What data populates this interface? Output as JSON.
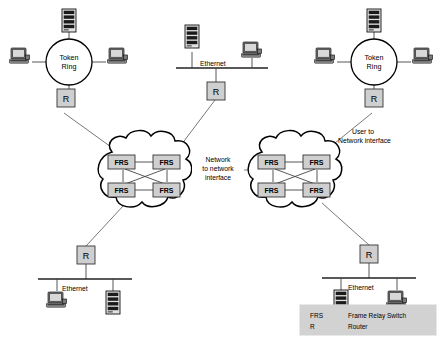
{
  "diagram": {
    "background_color": "#ffffff",
    "line_color": "#555555",
    "node_fill": "#cfcfcf",
    "legend_fill": "#d2d2d2"
  },
  "labels": {
    "token_ring_left_line1": "Token",
    "token_ring_left_line2": "Ring",
    "token_ring_right_line1": "Token",
    "token_ring_right_line2": "Ring",
    "router": "R",
    "frs": "FRS",
    "ethernet_top": "Ethernet",
    "ethernet_bottom_left": "Ethernet",
    "ethernet_bottom_right": "Ethernet"
  },
  "annotations": [
    {
      "name": "network-to-network-interface",
      "line1": "Network",
      "line2": "to network",
      "line3": "interface"
    },
    {
      "name": "user-to-network-interface",
      "line1": "User to",
      "line2": "Network interface"
    }
  ],
  "legend": {
    "rows": [
      {
        "abbr": "FRS",
        "meaning": "Frame Relay Switch"
      },
      {
        "abbr": "R",
        "meaning": "Router"
      }
    ]
  },
  "lans": [
    {
      "name": "token-ring-left",
      "type": "token-ring",
      "hosts": [
        "server",
        "workstation",
        "workstation"
      ],
      "router": "R"
    },
    {
      "name": "ethernet-top",
      "type": "ethernet",
      "label": "Ethernet",
      "hosts": [
        "server",
        "workstation"
      ],
      "router": "R"
    },
    {
      "name": "token-ring-right",
      "type": "token-ring",
      "hosts": [
        "server",
        "workstation",
        "workstation"
      ],
      "router": "R"
    },
    {
      "name": "ethernet-bottom-left",
      "type": "ethernet",
      "label": "Ethernet",
      "hosts": [
        "workstation",
        "server"
      ],
      "router": "R"
    },
    {
      "name": "ethernet-bottom-right",
      "type": "ethernet",
      "label": "Ethernet",
      "hosts": [
        "server",
        "workstation"
      ],
      "router": "R"
    }
  ],
  "clouds": [
    {
      "name": "frame-relay-cloud-left",
      "switches": [
        "FRS",
        "FRS",
        "FRS",
        "FRS"
      ]
    },
    {
      "name": "frame-relay-cloud-right",
      "switches": [
        "FRS",
        "FRS",
        "FRS",
        "FRS"
      ]
    }
  ]
}
